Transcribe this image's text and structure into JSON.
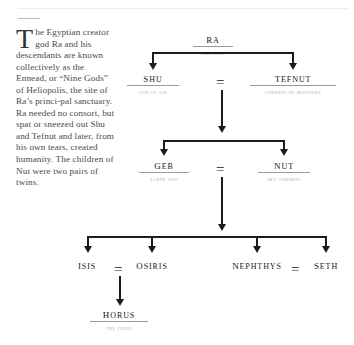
{
  "document": {
    "body_text_dropcap": "T",
    "body_text": "he Egyptian creator god Ra and his descendants are known collectively as the Ennead, or “Nine Gods” of Heliopolis, the site of Ra’s princi-pal sanctuary. Ra needed no consort, but spat or sneezed out Shu and Tefnut and later, from his own tears, created humanity. The children of Nut were two pairs of twins."
  },
  "diagram": {
    "type": "family-tree",
    "marriage_symbol": "=",
    "nodes": [
      {
        "id": "ra",
        "name": "Ra",
        "subtitle": "Sun God"
      },
      {
        "id": "shu",
        "name": "Shu",
        "subtitle": "God of Air"
      },
      {
        "id": "tefnut",
        "name": "Tefnut",
        "subtitle": "Goddess of Moisture"
      },
      {
        "id": "geb",
        "name": "Geb",
        "subtitle": "Earth God"
      },
      {
        "id": "nut",
        "name": "Nut",
        "subtitle": "Sky Goddess"
      },
      {
        "id": "isis",
        "name": "Isis",
        "subtitle": ""
      },
      {
        "id": "osiris",
        "name": "Osiris",
        "subtitle": ""
      },
      {
        "id": "nephthys",
        "name": "Nephthys",
        "subtitle": ""
      },
      {
        "id": "seth",
        "name": "Seth",
        "subtitle": ""
      },
      {
        "id": "horus",
        "name": "Horus",
        "subtitle": "The Child"
      }
    ],
    "marriages": [
      {
        "left": "shu",
        "right": "tefnut",
        "symbol": "="
      },
      {
        "left": "geb",
        "right": "nut",
        "symbol": "="
      },
      {
        "left": "isis",
        "right": "osiris",
        "symbol": "="
      },
      {
        "left": "nephthys",
        "right": "seth",
        "symbol": "="
      }
    ],
    "edges": [
      {
        "from": "ra",
        "to": [
          "shu",
          "tefnut"
        ]
      },
      {
        "from": "shu+tefnut",
        "to": [
          "geb",
          "nut"
        ]
      },
      {
        "from": "geb+nut",
        "to": [
          "isis",
          "osiris",
          "nephthys",
          "seth"
        ]
      },
      {
        "from": "isis+osiris",
        "to": [
          "horus"
        ]
      }
    ]
  },
  "colors": {
    "ink": "#1c1c1f",
    "name": "#17171b",
    "subtitle": "#a9a8ad",
    "body": "#4b4a4c",
    "rule": "#9b9b9b",
    "page": "#ffffff"
  }
}
